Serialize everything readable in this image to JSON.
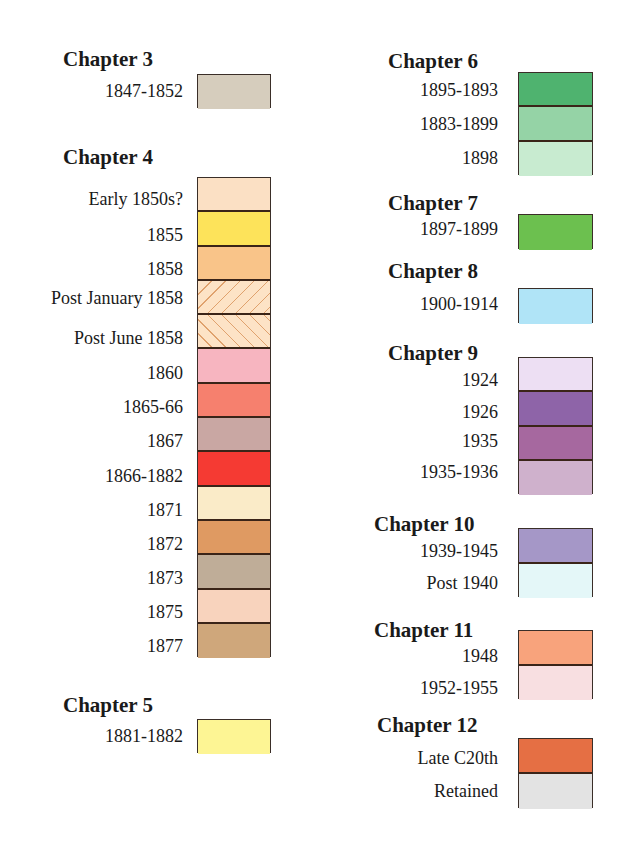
{
  "legend": {
    "chapters": [
      {
        "title": "Chapter 3",
        "entries": [
          {
            "label": "1847-1852",
            "color": "#d6cdbd"
          }
        ]
      },
      {
        "title": "Chapter 4",
        "entries": [
          {
            "label": "Early 1850s?",
            "color": "#fbe0c4"
          },
          {
            "label": "1855",
            "color": "#fde35a"
          },
          {
            "label": "1858",
            "color": "#f9c489"
          },
          {
            "label": "Post January 1858",
            "color": "#fde3c6",
            "pattern": "hatch-forward"
          },
          {
            "label": "Post June 1858",
            "color": "#fde3c6",
            "pattern": "hatch-back"
          },
          {
            "label": "1860",
            "color": "#f7b5c0"
          },
          {
            "label": "1865-66",
            "color": "#f6806e"
          },
          {
            "label": "1867",
            "color": "#c9a7a3"
          },
          {
            "label": "1866-1882",
            "color": "#f53a33"
          },
          {
            "label": "1871",
            "color": "#faebc8"
          },
          {
            "label": "1872",
            "color": "#df9a62"
          },
          {
            "label": "1873",
            "color": "#bfad98"
          },
          {
            "label": "1875",
            "color": "#f8d3bd"
          },
          {
            "label": "1877",
            "color": "#cfa77b"
          }
        ]
      },
      {
        "title": "Chapter 5",
        "entries": [
          {
            "label": "1881-1882",
            "color": "#fdf594"
          }
        ]
      },
      {
        "title": "Chapter 6",
        "entries": [
          {
            "label": "1895-1893",
            "color": "#4fb36f"
          },
          {
            "label": "1883-1899",
            "color": "#95d3a6"
          },
          {
            "label": "1898",
            "color": "#c8ebd0"
          }
        ]
      },
      {
        "title": "Chapter 7",
        "entries": [
          {
            "label": "1897-1899",
            "color": "#6cc04f"
          }
        ]
      },
      {
        "title": "Chapter 8",
        "entries": [
          {
            "label": "1900-1914",
            "color": "#b0e4f7"
          }
        ]
      },
      {
        "title": "Chapter 9",
        "entries": [
          {
            "label": "1924",
            "color": "#eddff3"
          },
          {
            "label": "1926",
            "color": "#8e64a8"
          },
          {
            "label": "1935",
            "color": "#a6689f"
          },
          {
            "label": "1935-1936",
            "color": "#cfb1cc"
          }
        ]
      },
      {
        "title": "Chapter 10",
        "entries": [
          {
            "label": "1939-1945",
            "color": "#a597c7"
          },
          {
            "label": "Post 1940",
            "color": "#e4f7f8"
          }
        ]
      },
      {
        "title": "Chapter 11",
        "entries": [
          {
            "label": "1948",
            "color": "#f8a37c"
          },
          {
            "label": "1952-1955",
            "color": "#f8dfe1"
          }
        ]
      },
      {
        "title": "Chapter 12",
        "entries": [
          {
            "label": "Late C20th",
            "color": "#e56f44"
          },
          {
            "label": "Retained",
            "color": "#e3e3e3"
          }
        ]
      }
    ]
  }
}
